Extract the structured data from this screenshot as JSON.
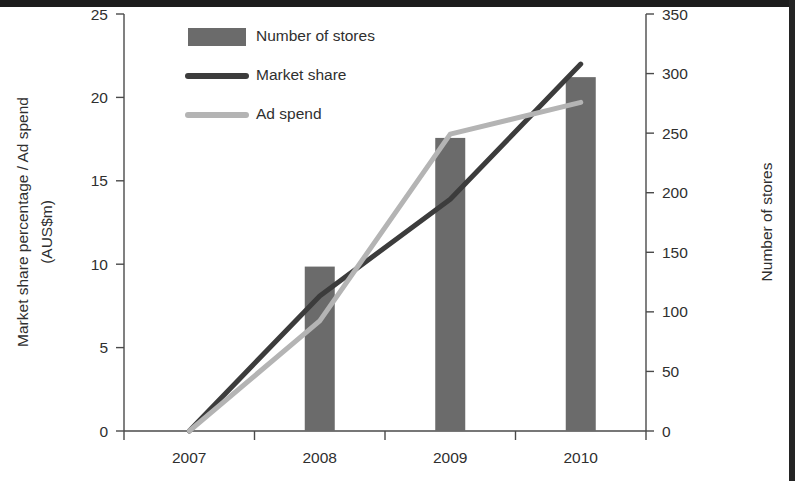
{
  "chart_data": {
    "type": "bar",
    "title": "",
    "subtitle": "",
    "categories": [
      "2007",
      "2008",
      "2009",
      "2010"
    ],
    "xlabel": "",
    "ylabel": "Market share percentage / Ad spend",
    "ylabel_line2": "(AUS$m)",
    "y2label": "Number of stores",
    "ylim": [
      0,
      25
    ],
    "y2lim": [
      0,
      350
    ],
    "yticks": [
      "0",
      "5",
      "10",
      "15",
      "20",
      "25"
    ],
    "ytick_values": [
      0,
      5,
      10,
      15,
      20,
      25
    ],
    "y2ticks": [
      "0",
      "50",
      "100",
      "150",
      "200",
      "250",
      "300",
      "350"
    ],
    "y2tick_values": [
      0,
      50,
      100,
      150,
      200,
      250,
      300,
      350
    ],
    "grid": false,
    "legend_position": "top-left-inside",
    "series": [
      {
        "name": "Number of stores",
        "type": "bar",
        "axis": "right",
        "color": "#6b6b6b",
        "values": [
          0,
          138,
          246,
          297
        ]
      },
      {
        "name": "Market share",
        "type": "line",
        "axis": "left",
        "color": "#3c3c3c",
        "values": [
          0,
          8.1,
          13.9,
          22.0
        ]
      },
      {
        "name": "Ad spend",
        "type": "line",
        "axis": "left",
        "color": "#b4b4b4",
        "values": [
          0,
          6.6,
          17.8,
          19.7
        ]
      }
    ]
  },
  "legend": {
    "items": [
      {
        "label": "Number of stores",
        "swatch": "bar",
        "color": "#6b6b6b"
      },
      {
        "label": "Market share",
        "swatch": "line",
        "color": "#3c3c3c"
      },
      {
        "label": "Ad spend",
        "swatch": "line",
        "color": "#b4b4b4"
      }
    ]
  },
  "axes": {
    "left_title_line1": "Market share percentage / Ad spend",
    "left_title_line2": "(AUS$m)",
    "right_title": "Number of stores"
  }
}
